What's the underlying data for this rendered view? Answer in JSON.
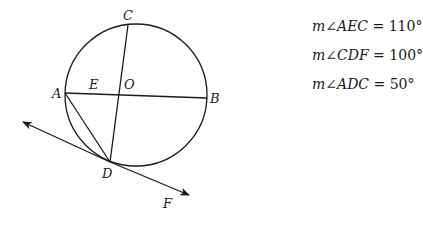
{
  "figure": {
    "circle": {
      "cx": 136,
      "cy": 95,
      "r": 71
    },
    "points": {
      "A": {
        "x": 65,
        "y": 93,
        "label": "A",
        "lx": 52,
        "ly": 98
      },
      "B": {
        "x": 207,
        "y": 98,
        "label": "B",
        "lx": 210,
        "ly": 103
      },
      "C": {
        "x": 128,
        "y": 25,
        "label": "C",
        "lx": 123,
        "ly": 20
      },
      "D": {
        "x": 110,
        "y": 162,
        "label": "D",
        "lx": 102,
        "ly": 178
      },
      "E": {
        "x": 95,
        "y": 94,
        "label": "E",
        "lx": 89,
        "ly": 89
      },
      "O": {
        "x": 120,
        "y": 95,
        "label": "O",
        "lx": 124,
        "ly": 89
      },
      "F": {
        "x": 168,
        "y": 205,
        "label": "F",
        "lx": 163,
        "ly": 208
      }
    },
    "tangent_line": {
      "x1": 23,
      "y1": 122,
      "x2": 189,
      "y2": 195
    }
  },
  "givens": [
    {
      "m": "m",
      "angle_symbol": "∠",
      "angle": "AEC",
      "eq": " = ",
      "value": "110°"
    },
    {
      "m": "m",
      "angle_symbol": "∠",
      "angle": "CDF",
      "eq": " = ",
      "value": "100°"
    },
    {
      "m": "m",
      "angle_symbol": "∠",
      "angle": "ADC",
      "eq": " = ",
      "value": "50°"
    }
  ]
}
